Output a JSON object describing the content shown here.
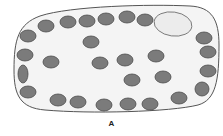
{
  "diagram": {
    "label": "A",
    "colors": {
      "cell_fill": "#f4f4f4",
      "cell_stroke": "#555555",
      "granule_fill": "#7b7b7b",
      "granule_stroke": "#4a4a4a",
      "vacuole_fill": "#ececec",
      "vacuole_stroke": "#666666"
    },
    "granules": [
      {
        "cx": 46,
        "cy": 26,
        "rx": 8,
        "ry": 6
      },
      {
        "cx": 68,
        "cy": 22,
        "rx": 8,
        "ry": 6
      },
      {
        "cx": 87,
        "cy": 21,
        "rx": 8,
        "ry": 6
      },
      {
        "cx": 106,
        "cy": 19,
        "rx": 8,
        "ry": 6
      },
      {
        "cx": 127,
        "cy": 17,
        "rx": 8,
        "ry": 6
      },
      {
        "cx": 145,
        "cy": 20,
        "rx": 8,
        "ry": 6
      },
      {
        "cx": 28,
        "cy": 36,
        "rx": 8,
        "ry": 6
      },
      {
        "cx": 25,
        "cy": 55,
        "rx": 8,
        "ry": 6
      },
      {
        "cx": 23,
        "cy": 74,
        "rx": 5,
        "ry": 9
      },
      {
        "cx": 28,
        "cy": 92,
        "rx": 8,
        "ry": 6
      },
      {
        "cx": 204,
        "cy": 38,
        "rx": 8,
        "ry": 6
      },
      {
        "cx": 208,
        "cy": 52,
        "rx": 8,
        "ry": 6
      },
      {
        "cx": 208,
        "cy": 71,
        "rx": 8,
        "ry": 6
      },
      {
        "cx": 202,
        "cy": 89,
        "rx": 7,
        "ry": 7
      },
      {
        "cx": 58,
        "cy": 100,
        "rx": 8,
        "ry": 6
      },
      {
        "cx": 78,
        "cy": 102,
        "rx": 8,
        "ry": 6
      },
      {
        "cx": 104,
        "cy": 105,
        "rx": 8,
        "ry": 6
      },
      {
        "cx": 128,
        "cy": 104,
        "rx": 8,
        "ry": 6
      },
      {
        "cx": 150,
        "cy": 104,
        "rx": 8,
        "ry": 6
      },
      {
        "cx": 179,
        "cy": 98,
        "rx": 8,
        "ry": 6
      },
      {
        "cx": 91,
        "cy": 42,
        "rx": 8,
        "ry": 6
      },
      {
        "cx": 51,
        "cy": 62,
        "rx": 8,
        "ry": 6
      },
      {
        "cx": 100,
        "cy": 63,
        "rx": 8,
        "ry": 6
      },
      {
        "cx": 125,
        "cy": 60,
        "rx": 8,
        "ry": 6
      },
      {
        "cx": 156,
        "cy": 56,
        "rx": 8,
        "ry": 6
      },
      {
        "cx": 132,
        "cy": 80,
        "rx": 8,
        "ry": 6
      },
      {
        "cx": 163,
        "cy": 77,
        "rx": 8,
        "ry": 6
      }
    ],
    "vacuole": {
      "cx": 173,
      "cy": 24,
      "rx": 19,
      "ry": 12
    }
  }
}
